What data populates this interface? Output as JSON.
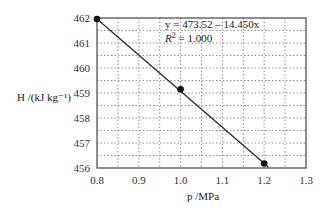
{
  "chart_data": {
    "type": "scatter",
    "title": "",
    "xlabel": "p /MPa",
    "ylabel": "H /(kJ kg⁻¹)",
    "xlim": [
      0.8,
      1.3
    ],
    "ylim": [
      456,
      462
    ],
    "x_ticks": [
      "0.8",
      "0.9",
      "1.0",
      "1.1",
      "1.2",
      "1.3"
    ],
    "y_ticks": [
      "456",
      "457",
      "458",
      "459",
      "460",
      "461",
      "462"
    ],
    "grid": true,
    "grid_style": "dotted",
    "legend": "none",
    "series": [
      {
        "name": "data",
        "x": [
          0.8,
          1.0,
          1.2
        ],
        "y": [
          461.96,
          459.15,
          456.18
        ],
        "marker": "circle"
      }
    ],
    "trendline": {
      "type": "linear",
      "intercept": 473.52,
      "slope": -14.45,
      "equation": "y = 473.52 – 14.450x",
      "r_squared": "R² = 1.000"
    },
    "annotations": [
      "y = 473.52 – 14.450x",
      "R² = 1.000"
    ]
  },
  "colors": {
    "line": "#2a2a2a",
    "marker": "#111111",
    "grid": "#777777",
    "frame": "#444444"
  }
}
